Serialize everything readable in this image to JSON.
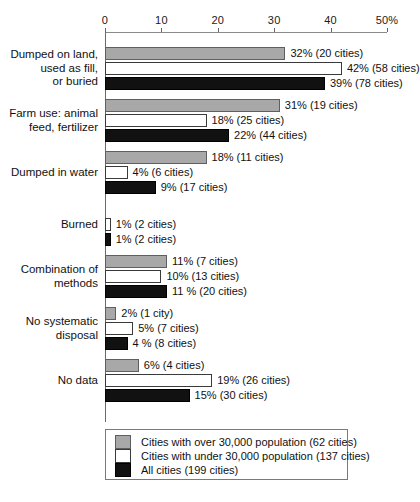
{
  "chart_data": {
    "type": "bar",
    "orientation": "horizontal",
    "title": "",
    "xlabel": "",
    "ylabel": "",
    "xlim": [
      0,
      50
    ],
    "grid": false,
    "legend_position": "bottom",
    "axis": {
      "ticks": [
        {
          "value": 0,
          "label": "0"
        },
        {
          "value": 10,
          "label": "10"
        },
        {
          "value": 20,
          "label": "20"
        },
        {
          "value": 30,
          "label": "30"
        },
        {
          "value": 40,
          "label": "40"
        },
        {
          "value": 50,
          "label": "50%"
        }
      ]
    },
    "categories": [
      "Dumped on land,\nused as fill,\nor buried",
      "Farm use: animal\nfeed, fertilizer",
      "Dumped in water",
      "Burned",
      "Combination of\nmethods",
      "No systematic\ndisposal",
      "No data"
    ],
    "series": [
      {
        "name": "Cities with over 30,000 population (62 cities)",
        "key": "over30k",
        "color": "#a8a8a8",
        "values": [
          32,
          31,
          18,
          0,
          11,
          2,
          6
        ],
        "labels": [
          "32% (20 cities)",
          "31% (19 cities)",
          "18% (11 cities)",
          "",
          "11% (7 cities)",
          "2% (1 city)",
          "6% (4 cities)"
        ]
      },
      {
        "name": "Cities with under 30,000 population (137 cities)",
        "key": "under30k",
        "color": "#ffffff",
        "values": [
          42,
          18,
          4,
          1,
          10,
          5,
          19
        ],
        "labels": [
          "42% (58 cities)",
          "18% (25 cities)",
          "4% (6 cities)",
          "1% (2 cities)",
          "10% (13 cities)",
          "5% (7 cities)",
          "19% (26 cities)"
        ]
      },
      {
        "name": "All cities (199 cities)",
        "key": "all",
        "color": "#111111",
        "values": [
          39,
          22,
          9,
          1,
          11,
          4,
          15
        ],
        "labels": [
          "39% (78 cities)",
          "22% (44 cities)",
          "9% (17 cities)",
          "1% (2 cities)",
          "11 % (20 cities)",
          "4 % (8 cities)",
          "15% (30 cities)"
        ]
      }
    ]
  },
  "legend": {
    "items": [
      {
        "swatch": "gray",
        "label": "Cities with over 30,000 population (62 cities)"
      },
      {
        "swatch": "white",
        "label": "Cities with under 30,000 population (137 cities)"
      },
      {
        "swatch": "black",
        "label": "All cities (199 cities)"
      }
    ]
  },
  "colors": {
    "over30k": "#a8a8a8",
    "under30k": "#ffffff",
    "all": "#111111",
    "axis": "#6a6a6a",
    "text": "#111111"
  }
}
